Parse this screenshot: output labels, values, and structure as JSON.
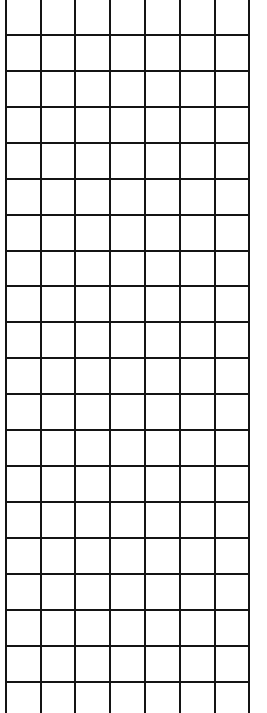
{
  "grid": {
    "background": "#ffffff",
    "line_color": "#141414",
    "line_width": 2,
    "vertical_lines_x": [
      5,
      40,
      74,
      109,
      144,
      179,
      214,
      248
    ],
    "horizontal_lines_y": [
      34,
      70,
      106,
      142,
      178,
      214,
      250,
      285,
      321,
      357,
      393,
      429,
      465,
      501,
      537,
      573,
      609,
      645,
      681
    ],
    "columns": 7,
    "rows_full": 18
  }
}
